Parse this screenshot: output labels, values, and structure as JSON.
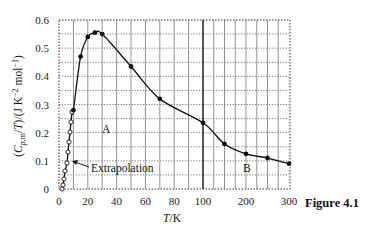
{
  "chart_data": {
    "type": "line",
    "title": "",
    "xlabel": "T/K",
    "ylabel": "(Cp,m/T)/(J K^-2 mol^-1)",
    "ylim": [
      0,
      0.6
    ],
    "x_axis": {
      "broken_scale": true,
      "segments": [
        {
          "range": [
            0,
            100
          ],
          "ticks": [
            0,
            20,
            40,
            60,
            80,
            100
          ],
          "grid_step": 10
        },
        {
          "range": [
            100,
            300
          ],
          "ticks": [
            100,
            200,
            300
          ],
          "grid_step": 25
        }
      ]
    },
    "y_ticks": [
      0,
      0.1,
      0.2,
      0.3,
      0.4,
      0.5,
      0.6
    ],
    "y_grid_step": 0.05,
    "grid": true,
    "series": [
      {
        "name": "Extrapolated / low-temperature data (open circles)",
        "marker": "open-circle",
        "x": [
          3,
          4,
          5,
          6,
          7,
          8,
          9,
          10,
          10,
          10
        ],
        "y": [
          0.0,
          0.01,
          0.03,
          0.06,
          0.09,
          0.13,
          0.165,
          0.2,
          0.235,
          0.27
        ]
      },
      {
        "name": "Measured data (filled circles)",
        "marker": "filled-circle",
        "x": [
          10,
          15,
          20,
          25,
          30,
          50,
          70,
          100,
          150,
          200,
          250,
          300
        ],
        "y": [
          0.28,
          0.47,
          0.54,
          0.555,
          0.55,
          0.435,
          0.32,
          0.235,
          0.16,
          0.125,
          0.11,
          0.09
        ]
      }
    ],
    "annotations": [
      {
        "text": "A",
        "x": 33,
        "y": 0.2
      },
      {
        "text": "B",
        "x": 205,
        "y": 0.075
      },
      {
        "text": "Extrapolation",
        "x": 15,
        "y": 0.09,
        "arrow_to": [
          9,
          0.11
        ]
      }
    ],
    "reference_line": {
      "orientation": "vertical",
      "x": 100
    }
  },
  "figure_caption": "Figure 4.1",
  "labels": {
    "xlabel_italic": "T",
    "xlabel_unit": "/K",
    "annotation_A": "A",
    "annotation_B": "B",
    "annotation_extrapolation": "Extrapolation"
  },
  "tick_labels": {
    "y": [
      "0",
      "0.1",
      "0.2",
      "0.3",
      "0.4",
      "0.5",
      "0.6"
    ],
    "x": [
      "0",
      "20",
      "40",
      "60",
      "80",
      "100",
      "200",
      "300"
    ]
  }
}
